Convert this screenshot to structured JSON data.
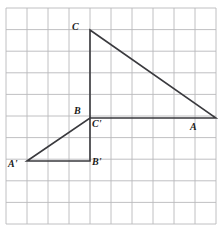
{
  "figure": {
    "background_color": "#ffffff",
    "grid": {
      "line_color": "#b9b9bb",
      "line_width": 0.9,
      "columns": 10,
      "rows": 10,
      "x_start": 6,
      "y_start": 8,
      "cell_width": 21,
      "cell_height": 21.6,
      "x_end": 216,
      "y_end": 224
    },
    "stroke_color": "#3a3a3e",
    "stroke_width": 1.6,
    "shapes": [
      {
        "name": "triangle-abc",
        "label": "ABC",
        "vertices": [
          {
            "name": "C",
            "x": 90,
            "y": 30
          },
          {
            "name": "A",
            "x": 216,
            "y": 118
          },
          {
            "name": "B",
            "x": 90,
            "y": 118
          }
        ]
      },
      {
        "name": "triangle-a-prime-b-prime-c-prime",
        "label": "A'B'C'",
        "vertices": [
          {
            "name": "A'",
            "x": 27,
            "y": 161
          },
          {
            "name": "C'",
            "x": 90,
            "y": 118
          },
          {
            "name": "B'",
            "x": 90,
            "y": 161
          }
        ]
      }
    ],
    "labels": [
      {
        "id": "label-C",
        "text": "C",
        "x": 72,
        "y": 22,
        "vertex": "C"
      },
      {
        "id": "label-A",
        "text": "A",
        "x": 190,
        "y": 122,
        "vertex": "A"
      },
      {
        "id": "label-B",
        "text": "B",
        "x": 74,
        "y": 106,
        "vertex": "B"
      },
      {
        "id": "label-Cprime",
        "text": "C'",
        "x": 92,
        "y": 119,
        "vertex": "C'"
      },
      {
        "id": "label-Aprime",
        "text": "A'",
        "x": 8,
        "y": 159,
        "vertex": "A'"
      },
      {
        "id": "label-Bprime",
        "text": "B'",
        "x": 92,
        "y": 157,
        "vertex": "B'"
      }
    ]
  }
}
